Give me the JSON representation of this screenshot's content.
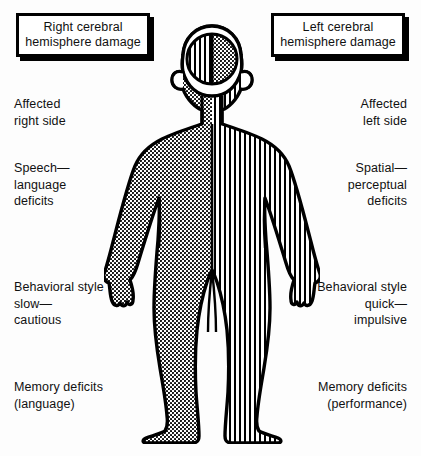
{
  "diagram": {
    "background_color": "#fdfdfd",
    "ink_color": "#000000"
  },
  "callouts": {
    "right_hemisphere": {
      "line1": "Right cerebral",
      "line2": "hemisphere damage"
    },
    "left_hemisphere": {
      "line1": "Left cerebral",
      "line2": "hemisphere damage"
    }
  },
  "left_column": {
    "affected_side": "Affected\nright side",
    "speech_language": "Speech—\nlanguage\ndeficits",
    "behavioral_style": "Behavioral style\nslow—\n  cautious",
    "memory_deficits": "Memory deficits\n(language)"
  },
  "right_column": {
    "affected_side": "Affected\nleft side",
    "spatial_perceptual": "Spatial—\nperceptual\ndeficits",
    "behavioral_style": "Behavioral style\nquick—\nimpulsive",
    "memory_deficits": "Memory deficits\n(performance)"
  },
  "figure": {
    "left_half_pattern": "dotted-stipple",
    "right_half_pattern": "vertical-stripes",
    "brain_left_pattern": "vertical-stripes",
    "brain_right_pattern": "dotted-stipple",
    "outline_color": "#000000",
    "fill_color": "#ffffff"
  }
}
